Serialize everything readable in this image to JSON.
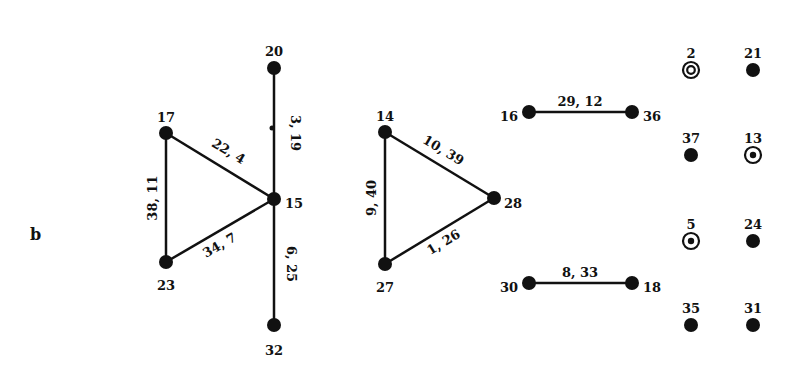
{
  "panel_label": "b",
  "colors": {
    "ink": "#111111",
    "background": "#ffffff"
  },
  "nodes": [
    {
      "id": "20",
      "label": "20",
      "x": 274,
      "y": 68,
      "style": "filled",
      "lx": 274,
      "ly": 52,
      "anchor": "middle"
    },
    {
      "id": "17",
      "label": "17",
      "x": 166,
      "y": 133,
      "style": "filled",
      "lx": 166,
      "ly": 118,
      "anchor": "middle"
    },
    {
      "id": "15",
      "label": "15",
      "x": 274,
      "y": 199,
      "style": "filled",
      "lx": 285,
      "ly": 204,
      "anchor": "start"
    },
    {
      "id": "23",
      "label": "23",
      "x": 166,
      "y": 262,
      "style": "filled",
      "lx": 166,
      "ly": 286,
      "anchor": "middle"
    },
    {
      "id": "32",
      "label": "32",
      "x": 274,
      "y": 325,
      "style": "filled",
      "lx": 274,
      "ly": 351,
      "anchor": "middle"
    },
    {
      "id": "14",
      "label": "14",
      "x": 385,
      "y": 132,
      "style": "filled",
      "lx": 385,
      "ly": 117,
      "anchor": "middle"
    },
    {
      "id": "28",
      "label": "28",
      "x": 494,
      "y": 198,
      "style": "filled",
      "lx": 504,
      "ly": 204,
      "anchor": "start"
    },
    {
      "id": "27",
      "label": "27",
      "x": 385,
      "y": 264,
      "style": "filled",
      "lx": 385,
      "ly": 288,
      "anchor": "middle"
    },
    {
      "id": "16",
      "label": "16",
      "x": 529,
      "y": 112,
      "style": "filled",
      "lx": 518,
      "ly": 117,
      "anchor": "end"
    },
    {
      "id": "36",
      "label": "36",
      "x": 632,
      "y": 112,
      "style": "filled",
      "lx": 643,
      "ly": 117,
      "anchor": "start"
    },
    {
      "id": "30",
      "label": "30",
      "x": 529,
      "y": 283,
      "style": "filled",
      "lx": 518,
      "ly": 288,
      "anchor": "end"
    },
    {
      "id": "18",
      "label": "18",
      "x": 632,
      "y": 283,
      "style": "filled",
      "lx": 643,
      "ly": 288,
      "anchor": "start"
    },
    {
      "id": "2",
      "label": "2",
      "x": 691,
      "y": 70,
      "style": "double-ring",
      "lx": 691,
      "ly": 54,
      "anchor": "middle"
    },
    {
      "id": "21",
      "label": "21",
      "x": 753,
      "y": 70,
      "style": "filled",
      "lx": 753,
      "ly": 54,
      "anchor": "middle"
    },
    {
      "id": "37",
      "label": "37",
      "x": 691,
      "y": 155,
      "style": "filled",
      "lx": 691,
      "ly": 139,
      "anchor": "middle"
    },
    {
      "id": "13",
      "label": "13",
      "x": 753,
      "y": 155,
      "style": "ring-dot",
      "lx": 753,
      "ly": 139,
      "anchor": "middle"
    },
    {
      "id": "5",
      "label": "5",
      "x": 691,
      "y": 241,
      "style": "ring-dot",
      "lx": 691,
      "ly": 225,
      "anchor": "middle"
    },
    {
      "id": "24",
      "label": "24",
      "x": 753,
      "y": 241,
      "style": "filled",
      "lx": 753,
      "ly": 225,
      "anchor": "middle"
    },
    {
      "id": "35",
      "label": "35",
      "x": 691,
      "y": 325,
      "style": "filled",
      "lx": 691,
      "ly": 309,
      "anchor": "middle"
    },
    {
      "id": "31",
      "label": "31",
      "x": 753,
      "y": 325,
      "style": "filled",
      "lx": 753,
      "ly": 309,
      "anchor": "middle"
    }
  ],
  "edges": [
    {
      "from": "20",
      "to": "15",
      "label": "3, 19",
      "lx": 294,
      "ly": 133,
      "rot": 90
    },
    {
      "from": "15",
      "to": "32",
      "label": "6, 25",
      "lx": 290,
      "ly": 264,
      "rot": 90
    },
    {
      "from": "17",
      "to": "15",
      "label": "22, 4",
      "lx": 228,
      "ly": 152,
      "rot": 31
    },
    {
      "from": "17",
      "to": "23",
      "label": "38, 11",
      "lx": 153,
      "ly": 198,
      "rot": -90
    },
    {
      "from": "23",
      "to": "15",
      "label": "34, 7",
      "lx": 220,
      "ly": 246,
      "rot": -30
    },
    {
      "from": "14",
      "to": "28",
      "label": "10, 39",
      "lx": 443,
      "ly": 151,
      "rot": 31
    },
    {
      "from": "14",
      "to": "27",
      "label": "9, 40",
      "lx": 372,
      "ly": 198,
      "rot": -90
    },
    {
      "from": "27",
      "to": "28",
      "label": "1, 26",
      "lx": 444,
      "ly": 243,
      "rot": -31
    },
    {
      "from": "16",
      "to": "36",
      "label": "29, 12",
      "lx": 580,
      "ly": 102,
      "rot": 0
    },
    {
      "from": "30",
      "to": "18",
      "label": "8, 33",
      "lx": 580,
      "ly": 273,
      "rot": 0
    }
  ],
  "marks": [
    {
      "type": "tick",
      "x": 272,
      "y": 128
    }
  ]
}
